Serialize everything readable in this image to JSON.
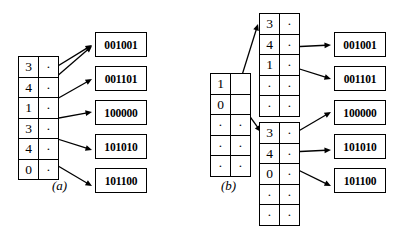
{
  "figure": {
    "panels": [
      {
        "id": "a",
        "label": "(a)",
        "label_x": 52,
        "label_y": 178,
        "description": "Single flat index table with six entries, each pointing to one data record",
        "tables": [
          {
            "id": "a-index",
            "name": "flat-index-table",
            "x": 18,
            "y": 56,
            "rows": [
              {
                "key": "3",
                "ptr": "·"
              },
              {
                "key": "4",
                "ptr": "·"
              },
              {
                "key": "1",
                "ptr": "·"
              },
              {
                "key": "3",
                "ptr": "·"
              },
              {
                "key": "4",
                "ptr": "·"
              },
              {
                "key": "0",
                "ptr": "·"
              }
            ]
          }
        ],
        "records": [
          {
            "value": "001001",
            "x": 95,
            "y": 32
          },
          {
            "value": "001101",
            "x": 95,
            "y": 66
          },
          {
            "value": "100000",
            "x": 95,
            "y": 100
          },
          {
            "value": "101010",
            "x": 95,
            "y": 134
          },
          {
            "value": "101100",
            "x": 95,
            "y": 168
          }
        ],
        "arrows": [
          {
            "name": "arrow-a-row1-to-001001",
            "x1": 48,
            "y1": 72,
            "x2": 92,
            "y2": 45
          },
          {
            "name": "arrow-a-row2-to-001001",
            "x1": 48,
            "y1": 84,
            "x2": 92,
            "y2": 46
          },
          {
            "name": "arrow-a-row3-to-001101",
            "x1": 48,
            "y1": 104,
            "x2": 92,
            "y2": 79
          },
          {
            "name": "arrow-a-row4-to-100000",
            "x1": 48,
            "y1": 120,
            "x2": 92,
            "y2": 112
          },
          {
            "name": "arrow-a-row5-to-101010",
            "x1": 48,
            "y1": 136,
            "x2": 92,
            "y2": 150
          },
          {
            "name": "arrow-a-row6-to-101100",
            "x1": 48,
            "y1": 160,
            "x2": 92,
            "y2": 186
          }
        ]
      },
      {
        "id": "b",
        "label": "(b)",
        "label_x": 221,
        "label_y": 178,
        "description": "Two-level index: a root table whose entries point to two second-level index tables, which in turn point to the data records",
        "tables": [
          {
            "id": "b-root",
            "name": "root-index-table",
            "x": 210,
            "y": 73,
            "rows": [
              {
                "key": "1",
                "ptr": ""
              },
              {
                "key": "0",
                "ptr": ""
              },
              {
                "key": "·",
                "ptr": "·"
              },
              {
                "key": "·",
                "ptr": "·"
              },
              {
                "key": "·",
                "ptr": "·"
              }
            ]
          },
          {
            "id": "b-leaf-top",
            "name": "second-level-index-table-top",
            "x": 259,
            "y": 13,
            "rows": [
              {
                "key": "3",
                "ptr": "·"
              },
              {
                "key": "4",
                "ptr": "·"
              },
              {
                "key": "1",
                "ptr": "·"
              },
              {
                "key": "·",
                "ptr": "·"
              },
              {
                "key": "·",
                "ptr": "·"
              }
            ]
          },
          {
            "id": "b-leaf-bottom",
            "name": "second-level-index-table-bottom",
            "x": 259,
            "y": 122,
            "rows": [
              {
                "key": "3",
                "ptr": "·"
              },
              {
                "key": "4",
                "ptr": "·"
              },
              {
                "key": "0",
                "ptr": "·"
              },
              {
                "key": "·",
                "ptr": "·"
              },
              {
                "key": "·",
                "ptr": "·"
              }
            ]
          }
        ],
        "records": [
          {
            "value": "001001",
            "x": 334,
            "y": 32
          },
          {
            "value": "001101",
            "x": 334,
            "y": 66
          },
          {
            "value": "100000",
            "x": 334,
            "y": 100
          },
          {
            "value": "101010",
            "x": 334,
            "y": 134
          },
          {
            "value": "101100",
            "x": 334,
            "y": 168
          }
        ],
        "arrows": [
          {
            "name": "arrow-b-root-row1-to-leaf-top",
            "x1": 238,
            "y1": 88,
            "x2": 258,
            "y2": 24
          },
          {
            "name": "arrow-b-root-row2-to-leaf-bottom",
            "x1": 238,
            "y1": 100,
            "x2": 261,
            "y2": 132
          },
          {
            "name": "arrow-b-leaftop-row2-to-001001",
            "x1": 290,
            "y1": 47,
            "x2": 331,
            "y2": 45
          },
          {
            "name": "arrow-b-leaftop-row3-to-001101",
            "x1": 290,
            "y1": 66,
            "x2": 331,
            "y2": 79
          },
          {
            "name": "arrow-b-leafbottom-row1-to-100000",
            "x1": 290,
            "y1": 136,
            "x2": 331,
            "y2": 112
          },
          {
            "name": "arrow-b-leafbottom-row2-to-101010",
            "x1": 290,
            "y1": 152,
            "x2": 331,
            "y2": 150
          },
          {
            "name": "arrow-b-leafbottom-row3-to-101100",
            "x1": 290,
            "y1": 166,
            "x2": 331,
            "y2": 186
          }
        ]
      }
    ]
  },
  "style": {
    "stroke_color": "#000000",
    "background_color": "#ffffff"
  }
}
